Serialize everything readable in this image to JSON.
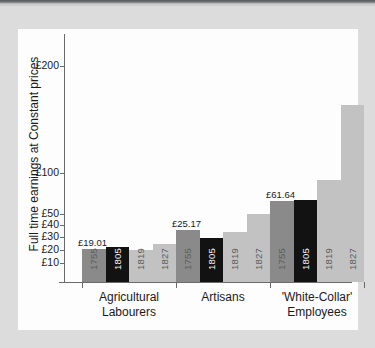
{
  "chart_data": {
    "type": "bar",
    "title": "",
    "xlabel": "",
    "ylabel": "Full time earnings at Constant prices",
    "yscale": "log-like",
    "ytick_labels": [
      "£200",
      "£100",
      "£50",
      "£40",
      "£30",
      "£20",
      "£10"
    ],
    "ytick_values": [
      200,
      100,
      50,
      40,
      30,
      20,
      10
    ],
    "categories": [
      "Agricultural Labourers",
      "Artisans",
      "'White-Collar' Employees"
    ],
    "series_name": "Year",
    "x": [
      "1755",
      "1805",
      "1819",
      "1827"
    ],
    "grid": false,
    "legend": "none",
    "data_labels": [
      "£19.01",
      "£25.17",
      "£61.64"
    ],
    "groups": [
      {
        "category": "Agricultural Labourers",
        "label_line1": "Agricultural",
        "label_line2": "Labourers",
        "annotation": "£19.01",
        "bars": [
          {
            "year": "1755",
            "value": 19.01,
            "shade": "dark-grey",
            "color": "#8a8a8a",
            "top_px": 249,
            "annotated": true
          },
          {
            "year": "1805",
            "value": 21.1,
            "shade": "black",
            "color": "#121212",
            "top_px": 247,
            "annotated": false
          },
          {
            "year": "1819",
            "value": 19.4,
            "shade": "light-grey",
            "color": "#c2c2c2",
            "top_px": 250,
            "annotated": false
          },
          {
            "year": "1827",
            "value": 23.0,
            "shade": "light-grey",
            "color": "#c2c2c2",
            "top_px": 244,
            "annotated": false
          }
        ]
      },
      {
        "category": "Artisans",
        "label_line1": "Artisans",
        "label_line2": "",
        "annotation": "£25.17",
        "bars": [
          {
            "year": "1755",
            "value": 38.5,
            "shade": "dark-grey",
            "color": "#8a8a8a",
            "top_px": 230,
            "annotated": true
          },
          {
            "year": "1805",
            "value": 25.17,
            "shade": "black",
            "color": "#121212",
            "top_px": 238,
            "annotated": false
          },
          {
            "year": "1819",
            "value": 37.0,
            "shade": "light-grey",
            "color": "#c2c2c2",
            "top_px": 232,
            "annotated": false
          },
          {
            "year": "1827",
            "value": 50.5,
            "shade": "light-grey",
            "color": "#c2c2c2",
            "top_px": 214,
            "annotated": false
          }
        ]
      },
      {
        "category": "'White-Collar' Employees",
        "label_line1": "'White-Collar'",
        "label_line2": "Employees",
        "annotation": "£61.64",
        "bars": [
          {
            "year": "1755",
            "value": 61.64,
            "shade": "dark-grey",
            "color": "#8a8a8a",
            "top_px": 201,
            "annotated": true
          },
          {
            "year": "1805",
            "value": 61.0,
            "shade": "black",
            "color": "#121212",
            "top_px": 200,
            "annotated": false
          },
          {
            "year": "1819",
            "value": 94.0,
            "shade": "light-grey",
            "color": "#c2c2c2",
            "top_px": 180,
            "annotated": false
          },
          {
            "year": "1827",
            "value": 160.0,
            "shade": "light-grey",
            "color": "#c2c2c2",
            "top_px": 105,
            "annotated": false
          }
        ]
      }
    ]
  },
  "colors": {
    "page_background": "#dcdcdc",
    "panel_background": "#fdfdfd",
    "axis": "#6a6a6a",
    "bar_dark_grey": "#8a8a8a",
    "bar_black": "#121212",
    "bar_light_grey": "#c2c2c2",
    "text": "#1a1a1a"
  }
}
